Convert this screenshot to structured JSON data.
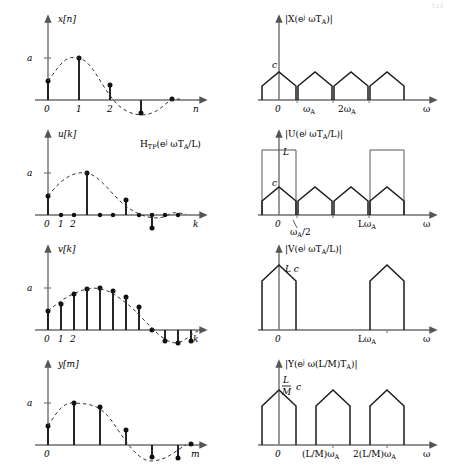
{
  "page": {
    "number": "123"
  },
  "figure": {
    "amplitude_label": "a",
    "rows": [
      {
        "id": "row-x",
        "time": {
          "signal_label": "x[n]",
          "axis_label": "n",
          "yticks": [
            "a"
          ],
          "xticks": [
            "0",
            "1",
            "2"
          ],
          "samples": [
            0.45,
            1.0,
            0.35,
            -0.32,
            0.02
          ]
        },
        "freq": {
          "signal_label": "|X(e^{j ωT_A})|",
          "label_parts": {
            "pre": "|X(e",
            "sup": "j ωT",
            "supsub": "A",
            "post": ")|"
          },
          "axis_label": "ω",
          "amplitude_label": "c",
          "xticks": [
            "0",
            "ω_A",
            "2ω_A"
          ],
          "replica_centers": [
            0,
            1,
            2,
            3
          ],
          "replica_height": 1.0,
          "shape": "pentagon"
        }
      },
      {
        "id": "row-u",
        "time": {
          "signal_label": "u[k]",
          "axis_label": "k",
          "yticks": [
            "a"
          ],
          "xticks": [
            "0",
            "1",
            "2"
          ],
          "samples": [
            0.45,
            0,
            0,
            1.0,
            0,
            0,
            0.35,
            0,
            0,
            -0.32,
            0,
            0,
            0.02
          ]
        },
        "freq": {
          "signal_label": "|U(e^{j ωT_A/L})|",
          "filter_label": "H_TP(e^{j ωT_A/L})",
          "axis_label": "ω",
          "amplitude_label": "c",
          "filter_height_label": "L",
          "xticks": [
            "0",
            "ω_A/2",
            "Lω_A"
          ],
          "replica_centers": [
            0,
            1,
            2,
            3
          ],
          "replica_height": 1.0,
          "filter_passbands": [
            0,
            3
          ],
          "filter_height": 3.0
        }
      },
      {
        "id": "row-v",
        "time": {
          "signal_label": "v[k]",
          "axis_label": "k",
          "yticks": [
            "a"
          ],
          "xticks": [
            "0",
            "1",
            "2"
          ],
          "samples": [
            0.45,
            0.62,
            0.86,
            0.97,
            1.0,
            0.93,
            0.78,
            0.55,
            0.3,
            0.05,
            -0.18,
            -0.3,
            -0.32,
            -0.27,
            -0.15,
            0.02
          ]
        },
        "freq": {
          "signal_label": "|V(e^{j ωT_A/L})|",
          "axis_label": "ω",
          "amplitude_label": "L c",
          "xticks": [
            "0",
            "Lω_A"
          ],
          "replica_centers": [
            0,
            3
          ],
          "replica_height": 3.0,
          "shape": "pentagon"
        }
      },
      {
        "id": "row-y",
        "time": {
          "signal_label": "y[m]",
          "axis_label": "m",
          "yticks": [
            "a"
          ],
          "xticks": [
            "0"
          ],
          "samples": [
            0.45,
            1.0,
            0.9,
            0.34,
            -0.28,
            -0.3,
            0.02
          ]
        },
        "freq": {
          "signal_label": "|Y(e^{j ω(L/M)T_A})|",
          "axis_label": "ω",
          "amplitude_label_num": "L",
          "amplitude_label_den": "M",
          "amplitude_label_tail": "c",
          "xticks": [
            "0",
            "(L/M)ω_A",
            "2(L/M)ω_A"
          ],
          "replica_centers": [
            0,
            1.5,
            3
          ],
          "replica_height": 2.2,
          "shape": "pentagon"
        }
      }
    ]
  }
}
